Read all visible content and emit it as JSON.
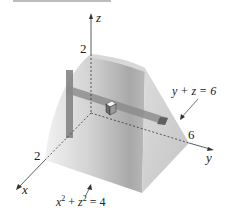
{
  "figure": {
    "type": "3d-solid-region",
    "axes": {
      "x": {
        "label": "x",
        "tick_label": "2"
      },
      "y": {
        "label": "y",
        "tick_label": "6"
      },
      "z": {
        "label": "z",
        "tick_label": "2"
      }
    },
    "surfaces": {
      "cylinder": {
        "equation_lhs_a": "x",
        "equation_exp_a": "2",
        "equation_plus": " + ",
        "equation_lhs_b": "z",
        "equation_exp_b": "2",
        "equation_rhs": " = 4"
      },
      "plane": {
        "equation": "y + z = 6"
      }
    },
    "colors": {
      "solid_light": "#e6e6e6",
      "solid_mid": "#c8c8c8",
      "solid_dark": "#9a9a9a",
      "strip": "#8c8c8c",
      "axis": "#333333"
    }
  }
}
